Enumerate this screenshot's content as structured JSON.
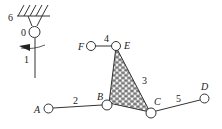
{
  "diagram": {
    "type": "planar linkage mechanism",
    "links": [
      {
        "id": "0",
        "label": "0",
        "desc": "pivot at ground"
      },
      {
        "id": "1",
        "label": "1",
        "desc": "rotating vertical link"
      },
      {
        "id": "2",
        "label": "2",
        "desc": "link A-B"
      },
      {
        "id": "3",
        "label": "3",
        "desc": "triangular link B-C-E (hatched)"
      },
      {
        "id": "4",
        "label": "4",
        "desc": "link F-E"
      },
      {
        "id": "5",
        "label": "5",
        "desc": "link C-D"
      },
      {
        "id": "6",
        "label": "6",
        "desc": "ground / frame"
      }
    ],
    "joints": {
      "A": {
        "label": "A"
      },
      "B": {
        "label": "B"
      },
      "C": {
        "label": "C"
      },
      "D": {
        "label": "D"
      },
      "E": {
        "label": "E"
      },
      "F": {
        "label": "F"
      }
    },
    "colors": {
      "line": "#333333",
      "hatch": "#555555"
    }
  }
}
